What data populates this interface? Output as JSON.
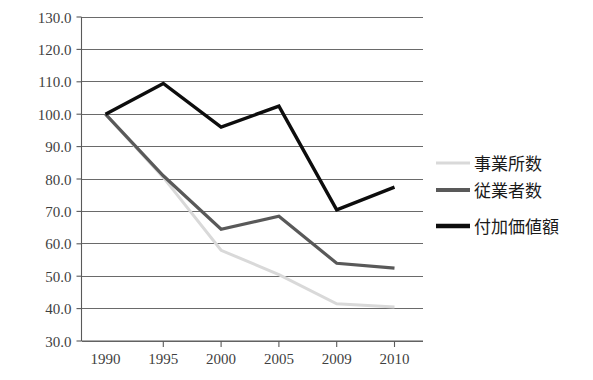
{
  "chart_data": {
    "type": "line",
    "title": "",
    "subtitle": "",
    "xlabel": "",
    "ylabel": "",
    "categories": [
      "1990",
      "1995",
      "2000",
      "2005",
      "2009",
      "2010"
    ],
    "x": [
      "1990",
      "1995",
      "2000",
      "2005",
      "2009",
      "2010"
    ],
    "ylim": [
      30.0,
      130.0
    ],
    "ytick_step": 10.0,
    "yticks": [
      "130.0",
      "120.0",
      "110.0",
      "100.0",
      "90.0",
      "80.0",
      "70.0",
      "60.0",
      "50.0",
      "40.0",
      "30.0"
    ],
    "ytick_values": [
      130.0,
      120.0,
      110.0,
      100.0,
      90.0,
      80.0,
      70.0,
      60.0,
      50.0,
      40.0,
      30.0
    ],
    "grid": true,
    "grid_axis": "y",
    "legend_position": "right",
    "series": [
      {
        "name": "事業所数",
        "color": "#d9d9d9",
        "width": 3,
        "values": [
          100.0,
          80.5,
          58.0,
          50.5,
          41.5,
          40.5
        ]
      },
      {
        "name": "従業者数",
        "color": "#595959",
        "width": 3.2,
        "values": [
          100.0,
          81.0,
          64.5,
          68.5,
          54.0,
          52.5
        ]
      },
      {
        "name": "付加価値額",
        "color": "#0d0d0d",
        "width": 3.4,
        "values": [
          100.0,
          109.5,
          96.0,
          102.5,
          70.5,
          77.5
        ]
      }
    ]
  },
  "legend": {
    "items": [
      {
        "label": "事業所数",
        "color": "#d9d9d9"
      },
      {
        "label": "従業者数",
        "color": "#595959"
      },
      {
        "label": "付加価値額",
        "color": "#0d0d0d"
      }
    ]
  }
}
